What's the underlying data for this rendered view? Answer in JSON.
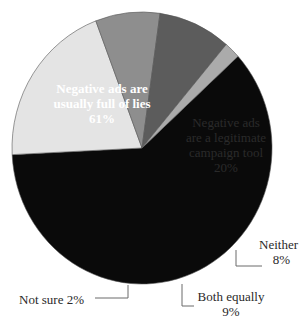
{
  "chart_data": {
    "type": "pie",
    "title": "",
    "slices": [
      {
        "label": "Negative ads are usually full of lies",
        "value": 61,
        "display": "61%",
        "color": "#0a0a0a"
      },
      {
        "label": "Negative ads are a legitimate campaign tool",
        "value": 20,
        "display": "20%",
        "color": "#e4e4e4"
      },
      {
        "label": "Neither",
        "value": 8,
        "display": "8%",
        "color": "#8e8e8e"
      },
      {
        "label": "Both equally",
        "value": 9,
        "display": "9%",
        "color": "#5c5c5c"
      },
      {
        "label": "Not sure",
        "value": 2,
        "display": "2%",
        "color": "#ababab"
      }
    ],
    "start_angle_deg_clockwise_from_top": 47.6,
    "legend": "none (labels placed on or beside slices with leader lines)"
  },
  "labels": {
    "lies": {
      "line1": "Negative ads are",
      "line2": "usually full of lies",
      "pct": "61%"
    },
    "legit": {
      "line1": "Negative ads",
      "line2": "are a legitimate",
      "line3": "campaign tool",
      "pct": "20%"
    },
    "neither": {
      "line1": "Neither",
      "pct": "8%"
    },
    "both": {
      "line1": "Both equally",
      "pct": "9%"
    },
    "notsure": {
      "line1": "Not sure 2%"
    }
  }
}
